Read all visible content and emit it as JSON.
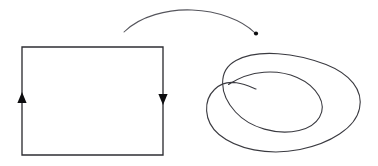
{
  "figure": {
    "canvas": {
      "width": 378,
      "height": 166,
      "background": "#ffffff"
    },
    "stroke_color": "#2e2e33",
    "curve_color": "#3a3a40",
    "arc_color": "#55555c",
    "arrowhead_color": "#0d0d0f"
  },
  "shapes": {
    "rectangle": {
      "name": "oriented-rectangle",
      "x": 22,
      "y": 47,
      "width": 141,
      "height": 108,
      "left": 22,
      "top": 47,
      "right": 163,
      "bottom": 155,
      "path": "M 22 47 L 163 47 L 163 155 L 22 155 Z"
    },
    "left_arrowhead": {
      "name": "left-edge-arrowhead",
      "direction": "up",
      "tip_x": 22,
      "tip_y": 92,
      "width": 9,
      "length": 11,
      "path": "M 22 92 L 26.6 103 L 17.4 103 Z"
    },
    "right_arrowhead": {
      "name": "right-edge-arrowhead",
      "direction": "down",
      "tip_x": 163,
      "tip_y": 105,
      "width": 9,
      "length": 11,
      "path": "M 163 105 L 158.4 94 L 167.6 94 Z"
    },
    "mapping_arc": {
      "name": "mapping-arrow",
      "start_x": 124,
      "start_y": 32,
      "apex_x": 190,
      "apex_y": 9,
      "end_x": 254,
      "end_y": 32,
      "path": "M 124 32 C 140 16, 168 9, 192 10 C 218 11, 242 20, 254.5 32.5"
    },
    "mapping_arrowhead": {
      "name": "mapping-arrowhead",
      "x": 256,
      "y": 33.5,
      "radius": 2.1
    },
    "spiral": {
      "name": "spiral-curve",
      "outer_bounds": {
        "left": 210,
        "top": 57,
        "right": 361,
        "bottom": 152
      },
      "inner_bounds": {
        "left": 228,
        "top": 72,
        "right": 322,
        "bottom": 131
      },
      "crossing_x": 230,
      "crossing_y": 82,
      "turns": 2,
      "path": "M 228.5 84.5 C 236 79.5, 248 73.5, 264 72.2 C 288 70.4, 310 80, 319 96 C 327.5 111, 318.5 126, 299 130.5 C 277 135.5, 250 128, 235.5 112 C 219 94, 217.5 70.5, 236 60.5 C 258 48.5, 296 53, 326 64.5 C 350 74, 363.5 90, 359.5 108.5 C 355.5 128, 330 143.5, 300 149.5 C 268 156, 236.5 149, 219 134.5 C 203 121, 203.5 100, 214.5 89.5 C 221 83, 228 81.5, 236.5 82.8 C 245 84, 251 87, 256 89"
    }
  }
}
